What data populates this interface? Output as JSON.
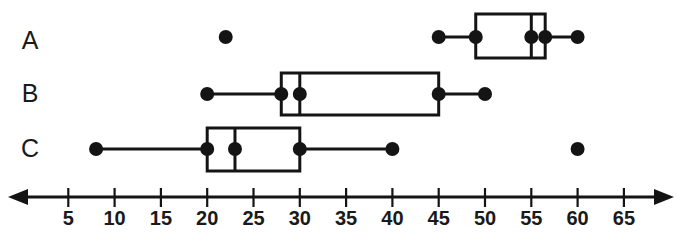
{
  "chart_data": {
    "type": "box",
    "title": "",
    "xlabel": "",
    "ylabel": "",
    "xlim": [
      0,
      68
    ],
    "grid": false,
    "legend": null,
    "axis": {
      "ticks": [
        5,
        10,
        15,
        20,
        25,
        30,
        35,
        40,
        45,
        50,
        55,
        60,
        65
      ],
      "tick_labels": [
        "5",
        "10",
        "15",
        "20",
        "25",
        "30",
        "35",
        "40",
        "45",
        "50",
        "55",
        "60",
        "65"
      ],
      "arrows": [
        "left",
        "right"
      ]
    },
    "categories": [
      "A",
      "B",
      "C"
    ],
    "series": [
      {
        "name": "A",
        "min": 45,
        "q1": 49,
        "median": 55,
        "q3": 56.5,
        "max": 60,
        "outliers": [
          22
        ],
        "points": [
          22,
          45,
          49,
          55,
          56.5,
          60
        ]
      },
      {
        "name": "B",
        "min": 20,
        "q1": 28,
        "median": 30,
        "q3": 45,
        "max": 50,
        "outliers": [],
        "points": [
          20,
          28,
          30,
          45,
          50
        ]
      },
      {
        "name": "C",
        "min": 8,
        "q1": 20,
        "median": 23,
        "q3": 30,
        "max": 40,
        "outliers": [
          60
        ],
        "points": [
          8,
          20,
          23,
          30,
          40,
          60
        ]
      }
    ]
  },
  "colors": {
    "ink": "#141414",
    "label": "#1a1a1a",
    "background": "#ffffff"
  },
  "geometry": {
    "value_zero_x": 22,
    "pixels_per_unit": 9.26,
    "axis_y": 197,
    "tick_top": 188,
    "tick_bottom": 207,
    "tick_label_y": 211,
    "label_x": 30,
    "dot_radius": 7,
    "rows": [
      {
        "name": "A",
        "center_y": 37,
        "box_top": 14,
        "box_bottom": 58,
        "label_y": 42
      },
      {
        "name": "B",
        "center_y": 94,
        "box_top": 73,
        "box_bottom": 115,
        "label_y": 95
      },
      {
        "name": "C",
        "center_y": 149,
        "box_top": 128,
        "box_bottom": 171,
        "label_y": 150
      }
    ]
  }
}
